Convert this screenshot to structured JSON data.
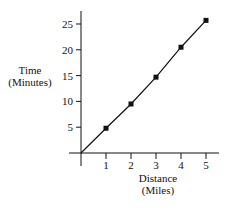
{
  "chart_data": {
    "type": "line",
    "title": "",
    "xlabel": "Distance (Miles)",
    "xlabel_lines": [
      "Distance",
      "(Miles)"
    ],
    "ylabel": "Time (Minutes)",
    "ylabel_lines": [
      "Time",
      "(Minutes)"
    ],
    "x": [
      0,
      1,
      2,
      3,
      4,
      5
    ],
    "series": [
      {
        "name": "Time",
        "values": [
          0,
          4.8,
          9.5,
          14.7,
          20.5,
          25.7
        ],
        "marker": "square",
        "color": "#111111"
      }
    ],
    "x_ticks": [
      "1",
      "2",
      "3",
      "4",
      "5"
    ],
    "y_ticks": [
      "5",
      "10",
      "15",
      "20",
      "25"
    ],
    "xlim": [
      0,
      5.5
    ],
    "ylim": [
      0,
      27
    ],
    "grid": false,
    "legend": "none"
  }
}
